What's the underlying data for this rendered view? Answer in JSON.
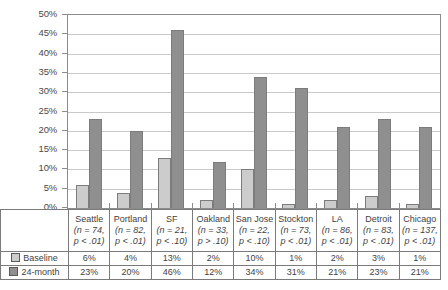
{
  "chart_data": {
    "type": "bar",
    "title": "",
    "xlabel": "",
    "ylabel": "",
    "ylim": [
      0,
      50
    ],
    "ytick_labels": [
      "50%",
      "45%",
      "40%",
      "35%",
      "30%",
      "25%",
      "20%",
      "15%",
      "10%",
      "5%",
      "0%"
    ],
    "ytick_values": [
      50,
      45,
      40,
      35,
      30,
      25,
      20,
      15,
      10,
      5,
      0
    ],
    "grid": true,
    "legend_position": "table-left",
    "categories": [
      "Seattle",
      "Portland",
      "SF",
      "Oakland",
      "San Jose",
      "Stockton",
      "LA",
      "Detroit",
      "Chicago"
    ],
    "series": [
      {
        "name": "Baseline",
        "values": [
          6,
          4,
          13,
          2,
          10,
          1,
          2,
          3,
          1
        ],
        "color": "#cccccc"
      },
      {
        "name": "24-month",
        "values": [
          23,
          20,
          46,
          12,
          34,
          31,
          21,
          23,
          21
        ],
        "color": "#8f8f8f"
      }
    ],
    "annotations": [
      "n = 74, p < .01",
      "n = 82, p < .01",
      "n = 21, p < .10",
      "n = 33, p > .10",
      "n = 22, p < .10",
      "n = 73, p < .01",
      "n = 86, p < .01",
      "n = 83, p < .01",
      "n = 137, p < .01"
    ]
  },
  "table": {
    "columns": [
      {
        "city": "Seattle",
        "n": "(n = 74,",
        "p": "p < .01)",
        "baseline": "6%",
        "month24": "23%"
      },
      {
        "city": "Portland",
        "n": "(n = 82,",
        "p": "p < .01)",
        "baseline": "4%",
        "month24": "20%"
      },
      {
        "city": "SF",
        "n": "(n = 21,",
        "p": "p < .10)",
        "baseline": "13%",
        "month24": "46%"
      },
      {
        "city": "Oakland",
        "n": "(n = 33,",
        "p": "p > .10)",
        "baseline": "2%",
        "month24": "12%"
      },
      {
        "city": "San Jose",
        "n": "(n = 22,",
        "p": "p < .10)",
        "baseline": "10%",
        "month24": "34%"
      },
      {
        "city": "Stockton",
        "n": "(n = 73,",
        "p": "p < .01)",
        "baseline": "1%",
        "month24": "31%"
      },
      {
        "city": "LA",
        "n": "(n = 86,",
        "p": "p < .01)",
        "baseline": "2%",
        "month24": "21%"
      },
      {
        "city": "Detroit",
        "n": "(n = 83,",
        "p": "p < .01)",
        "baseline": "3%",
        "month24": "23%"
      },
      {
        "city": "Chicago",
        "n": "(n = 137,",
        "p": "p < .01)",
        "baseline": "1%",
        "month24": "21%"
      }
    ],
    "legend": {
      "baseline_label": "Baseline",
      "month24_label": "24-month"
    }
  }
}
